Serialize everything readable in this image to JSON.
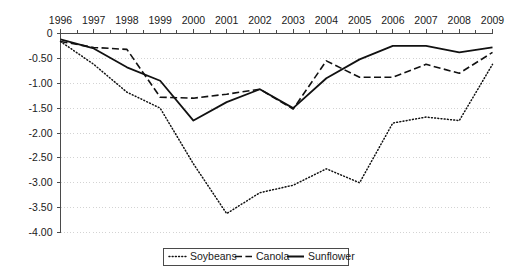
{
  "chart_data": {
    "type": "line",
    "title": "",
    "xlabel": "",
    "ylabel": "",
    "grid": true,
    "legend_position": "bottom",
    "x": [
      1996,
      1997,
      1998,
      1999,
      2000,
      2001,
      2002,
      2003,
      2004,
      2005,
      2006,
      2007,
      2008,
      2009
    ],
    "categories": [
      "1996",
      "1997",
      "1998",
      "1999",
      "2000",
      "2001",
      "2002",
      "2003",
      "2004",
      "2005",
      "2006",
      "2007",
      "2008",
      "2009"
    ],
    "xlim": [
      1996,
      2009
    ],
    "ylim": [
      -4.0,
      0.0
    ],
    "ytick_labels": [
      "0",
      "-0.50",
      "-1.00",
      "-1.50",
      "-2.00",
      "-2.50",
      "-3.00",
      "-3.50",
      "-4.00"
    ],
    "ytick_values": [
      0.0,
      -0.5,
      -1.0,
      -1.5,
      -2.0,
      -2.5,
      -3.0,
      -3.5,
      -4.0
    ],
    "series": [
      {
        "name": "Soybeans",
        "style": "dotted",
        "values": [
          -0.16,
          -0.62,
          -1.18,
          -1.5,
          -2.62,
          -3.62,
          -3.2,
          -3.05,
          -2.72,
          -3.0,
          -1.8,
          -1.68,
          -1.75,
          -0.62
        ]
      },
      {
        "name": "Canola",
        "style": "dashed",
        "values": [
          -0.16,
          -0.28,
          -0.32,
          -1.28,
          -1.3,
          -1.22,
          -1.12,
          -1.52,
          -0.55,
          -0.88,
          -0.88,
          -0.62,
          -0.8,
          -0.38
        ]
      },
      {
        "name": "Sunflower",
        "style": "solid",
        "values": [
          -0.12,
          -0.3,
          -0.68,
          -0.95,
          -1.75,
          -1.38,
          -1.12,
          -1.5,
          -0.9,
          -0.52,
          -0.25,
          -0.25,
          -0.38,
          -0.28
        ]
      }
    ]
  },
  "legend": {
    "entries": [
      {
        "label": "Soybeans",
        "style": "dotted"
      },
      {
        "label": "Canola",
        "style": "dashed"
      },
      {
        "label": "Sunflower",
        "style": "solid"
      }
    ]
  }
}
